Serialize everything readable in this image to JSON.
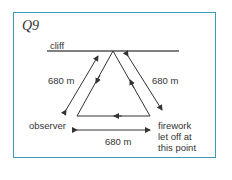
{
  "question": {
    "label": "Q9"
  },
  "diagram": {
    "cliff_label": "cliff",
    "left_distance": "680 m",
    "right_distance": "680 m",
    "bottom_distance": "680 m",
    "observer_label": "observer",
    "firework_label_lines": [
      "firework",
      "let off at",
      "this point"
    ]
  },
  "colors": {
    "frame": "#3a9ab8",
    "ink": "#333333"
  }
}
